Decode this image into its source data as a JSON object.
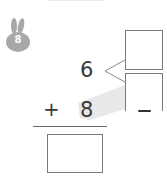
{
  "problem": {
    "badge_number": "8",
    "badge_icon": "rabbit-icon",
    "top_number": "6",
    "operator": "+",
    "bottom_number": "8",
    "decompose_boxes": [
      "",
      ""
    ],
    "answer_box": ""
  },
  "colors": {
    "badge": "#a8a8a8",
    "ink": "#3a3a3a",
    "box_border": "#7a7a7a",
    "shade": "#e6e6e6"
  }
}
